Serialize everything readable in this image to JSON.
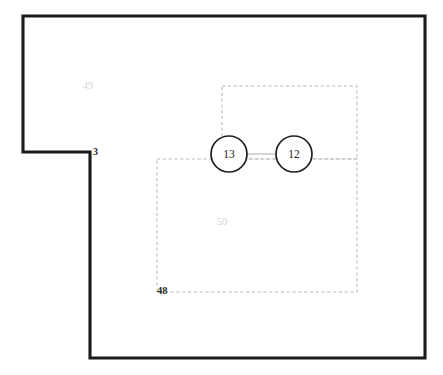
{
  "diagram": {
    "background_color": "#ffffff",
    "width": 443,
    "height": 375,
    "outer_boundary": {
      "name": "building-outline",
      "stroke_color": "#1a1a1a",
      "stroke_width": 3.1,
      "style": "solid",
      "shape": "L-shaped polygon",
      "points": "23,16 425,16 425,358 90,358 90,152 23,152 23,16"
    },
    "zones": [
      {
        "id": "zone-upper",
        "label": "",
        "style": "dashed",
        "stroke_color": "#b9b9b9",
        "x": 222,
        "y": 86,
        "width": 135,
        "height": 73
      },
      {
        "id": "zone-lower",
        "label": "50",
        "style": "dashed",
        "stroke_color": "#b9b9b9",
        "x": 157,
        "y": 159,
        "width": 200,
        "height": 133,
        "label_x": 222,
        "label_y": 223
      }
    ],
    "nodes": [
      {
        "id": "node-13",
        "label": "13",
        "cx": 229,
        "cy": 154,
        "r": 18,
        "fill": "#ffffff",
        "stroke_color": "#1d1d1d"
      },
      {
        "id": "node-12",
        "label": "12",
        "cx": 294,
        "cy": 154,
        "r": 18,
        "fill": "#ffffff",
        "stroke_color": "#1d1d1d"
      }
    ],
    "connectors": [
      {
        "id": "link-13-12",
        "from": "node-13",
        "to": "node-12",
        "x1": 247,
        "y1": 154,
        "x2": 276,
        "y2": 154,
        "stroke_color": "#a9a9a9"
      }
    ],
    "annotations": [
      {
        "id": "label-49",
        "text": "49",
        "x": 88,
        "y": 87,
        "color": "#d6d6d6",
        "kind": "zone-label"
      },
      {
        "id": "label-50",
        "text": "50",
        "x": 222,
        "y": 223,
        "color": "#d6d6d6",
        "kind": "zone-label"
      },
      {
        "id": "label-3",
        "text": "3",
        "x": 93,
        "y": 153,
        "color": "#2b2b2b",
        "kind": "corner-label"
      },
      {
        "id": "label-48",
        "text": "48",
        "x": 158,
        "y": 292,
        "color": "#2b2b2b",
        "kind": "corner-label"
      }
    ]
  }
}
